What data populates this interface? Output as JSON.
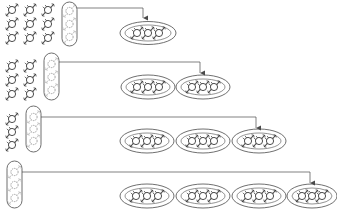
{
  "diagram": {
    "colors": {
      "stroke": "#4a4a4a",
      "item_stroke": "#3a3a3a",
      "faint_item_stroke": "#8a8a8a",
      "background": "#ffffff"
    },
    "stages": [
      {
        "stage": 1,
        "left_columns": 3,
        "items_per_column": 3,
        "grouped_column_highlighted": true,
        "bins_on_right": 1,
        "arrow_target_bin": 1
      },
      {
        "stage": 2,
        "left_columns": 2,
        "items_per_column": 3,
        "grouped_column_highlighted": true,
        "bins_on_right": 2,
        "arrow_target_bin": 2
      },
      {
        "stage": 3,
        "left_columns": 1,
        "items_per_column": 3,
        "grouped_column_highlighted": true,
        "bins_on_right": 3,
        "arrow_target_bin": 3
      },
      {
        "stage": 4,
        "left_columns": 0,
        "items_per_column": 3,
        "grouped_column_highlighted": true,
        "bins_on_right": 4,
        "arrow_target_bin": 4
      }
    ],
    "items_per_bin": 3,
    "item_icon": "wrapped-candy-icon"
  }
}
